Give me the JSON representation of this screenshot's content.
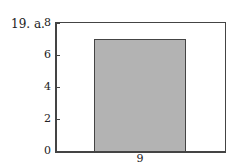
{
  "problem_label": "19. a.",
  "chart_data": {
    "type": "bar",
    "categories": [
      "9"
    ],
    "values": [
      7
    ],
    "title": "",
    "xlabel": "",
    "ylabel": "",
    "ylim": [
      0,
      8
    ],
    "yticks": [
      "0",
      "2",
      "4",
      "6",
      "8"
    ],
    "grid": false,
    "bar_color": "#b3b3b3"
  }
}
